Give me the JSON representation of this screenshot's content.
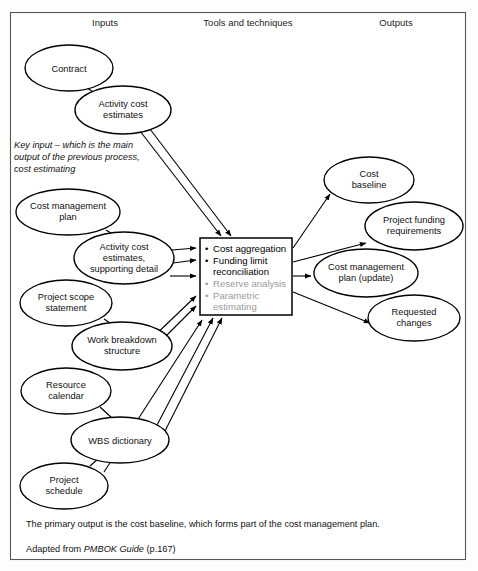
{
  "figure": {
    "columns": [
      {
        "name": "inputs",
        "label": "Inputs",
        "x": 105,
        "y": 26
      },
      {
        "name": "tools",
        "label": "Tools and techniques",
        "x": 248,
        "y": 26
      },
      {
        "name": "outputs",
        "label": "Outputs",
        "x": 396,
        "y": 26
      }
    ],
    "input_nodes": [
      {
        "name": "contract",
        "label_lines": [
          "Contract"
        ],
        "cx": 69,
        "cy": 68,
        "rx": 44,
        "ry": 23
      },
      {
        "name": "activity-cost-estimates",
        "label_lines": [
          "Activity cost",
          "estimates"
        ],
        "cx": 123,
        "cy": 110,
        "rx": 48,
        "ry": 24
      },
      {
        "name": "cost-management-plan",
        "label_lines": [
          "Cost management",
          "plan"
        ],
        "cx": 68,
        "cy": 212,
        "rx": 52,
        "ry": 23
      },
      {
        "name": "activity-cost-estimates-supporting-detail",
        "label_lines": [
          "Activity cost",
          "estimates,",
          "supporting detail"
        ],
        "cx": 124,
        "cy": 258,
        "rx": 50,
        "ry": 26
      },
      {
        "name": "project-scope-statement",
        "label_lines": [
          "Project scope",
          "statement"
        ],
        "cx": 66,
        "cy": 303,
        "rx": 46,
        "ry": 23
      },
      {
        "name": "work-breakdown-structure",
        "label_lines": [
          "Work breakdown",
          "structure"
        ],
        "cx": 122,
        "cy": 346,
        "rx": 50,
        "ry": 24
      },
      {
        "name": "resource-calendar",
        "label_lines": [
          "Resource",
          "calendar"
        ],
        "cx": 66,
        "cy": 391,
        "rx": 45,
        "ry": 23
      },
      {
        "name": "wbs-dictionary",
        "label_lines": [
          "WBS dictionary"
        ],
        "cx": 120,
        "cy": 440,
        "rx": 49,
        "ry": 23
      },
      {
        "name": "project-schedule",
        "label_lines": [
          "Project",
          "schedule"
        ],
        "cx": 64,
        "cy": 486,
        "rx": 44,
        "ry": 23
      }
    ],
    "output_nodes": [
      {
        "name": "cost-baseline",
        "label_lines": [
          "Cost",
          "baseline"
        ],
        "cx": 369,
        "cy": 180,
        "rx": 45,
        "ry": 23
      },
      {
        "name": "project-funding-requirements",
        "label_lines": [
          "Project funding",
          "requirements"
        ],
        "cx": 414,
        "cy": 226,
        "rx": 49,
        "ry": 24
      },
      {
        "name": "cost-management-plan-update",
        "label_lines": [
          "Cost management",
          "plan (update)"
        ],
        "cx": 366,
        "cy": 273,
        "rx": 52,
        "ry": 24
      },
      {
        "name": "requested-changes",
        "label_lines": [
          "Requested",
          "changes"
        ],
        "cx": 414,
        "cy": 318,
        "rx": 46,
        "ry": 23
      }
    ],
    "center_box": {
      "name": "tools-and-techniques-box",
      "x": 200,
      "y": 238,
      "width": 92,
      "height": 77,
      "bullets": [
        {
          "lines": [
            "Cost aggregation"
          ],
          "tone": "black"
        },
        {
          "lines": [
            "Funding limit",
            "reconciliation"
          ],
          "tone": "black"
        },
        {
          "lines": [
            "Reserve analysis"
          ],
          "tone": "gray"
        },
        {
          "lines": [
            "Parametric",
            "estimating"
          ],
          "tone": "gray"
        }
      ]
    },
    "note": {
      "name": "key-input-note",
      "lines": [
        "Key input – which is the main",
        "output of the previous process,",
        "cost estimating"
      ],
      "x": 14,
      "y": 148
    },
    "captions": [
      {
        "name": "primary-output-caption",
        "text": "The primary output is the cost baseline, which forms part of the cost management plan.",
        "x": 26,
        "y": 527
      }
    ],
    "source_caption": {
      "name": "source-caption",
      "prefix": "Adapted from ",
      "italic": "PMBOK Guide",
      "suffix": " (p.167)",
      "x": 26,
      "y": 552
    },
    "colors": {
      "frame_stroke": "#55565a",
      "node_stroke": "#000000",
      "text": "#111111",
      "muted_bullet": "#9b9b9b",
      "page_background": "#fdfdfc"
    },
    "frame": {
      "x": 10,
      "y": 12,
      "width": 456,
      "height": 548
    }
  }
}
